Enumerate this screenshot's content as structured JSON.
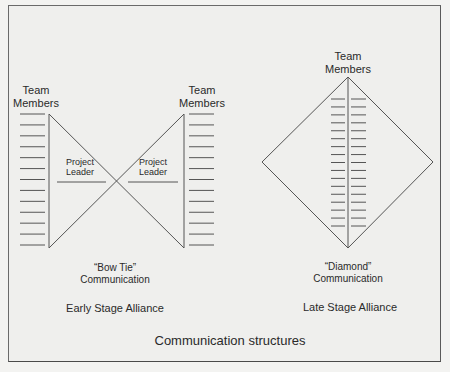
{
  "diagram": {
    "title": "Communication structures",
    "early": {
      "stage_label": "Early Stage Alliance",
      "structure_quote": "“Bow Tie”",
      "structure_word": "Communication",
      "team_left_line1": "Team",
      "team_left_line2": "Members",
      "team_right_line1": "Team",
      "team_right_line2": "Members",
      "leader_left_line1": "Project",
      "leader_left_line2": "Leader",
      "leader_right_line1": "Project",
      "leader_right_line2": "Leader",
      "member_count_per_side": 13
    },
    "late": {
      "stage_label": "Late Stage Alliance",
      "structure_quote": "“Diamond”",
      "structure_word": "Communication",
      "team_line1": "Team",
      "team_line2": "Members",
      "member_rows": 17,
      "member_columns": 2
    }
  }
}
